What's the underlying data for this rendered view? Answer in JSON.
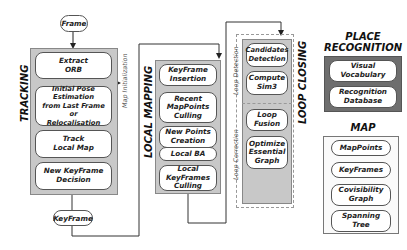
{
  "inputs": {
    "frame": "Frame",
    "keyframe": "KeyFrame"
  },
  "tracking": {
    "title": "TRACKING",
    "steps": [
      "Extract\nORB",
      "Initial Pose Estimation\nfrom Last Frame or\nRelocalisation",
      "Track\nLocal Map",
      "New KeyFrame\nDecision"
    ]
  },
  "map_initialization": "Map Initialization",
  "local_mapping": {
    "title": "LOCAL MAPPING",
    "steps": [
      "KeyFrame\nInsertion",
      "Recent\nMapPoints\nCulling",
      "New Points\nCreation",
      "Local BA",
      "Local\nKeyFrames\nCulling"
    ]
  },
  "loop_closing": {
    "title": "LOOP CLOSING",
    "loop_detection_label": "Loop Detection",
    "loop_correction_label": "Loop Correction",
    "detection_steps": [
      "Candidates\nDetection",
      "Compute\nSim3"
    ],
    "correction_steps": [
      "Loop\nFusion",
      "Optimize\nEssential\nGraph"
    ]
  },
  "place_recognition": {
    "title": "PLACE\nRECOGNITION",
    "items": [
      "Visual\nVocabulary",
      "Recognition\nDatabase"
    ]
  },
  "map": {
    "title": "MAP",
    "items": [
      "MapPoints",
      "KeyFrames",
      "Covisibility\nGraph",
      "Spanning\nTree"
    ]
  }
}
